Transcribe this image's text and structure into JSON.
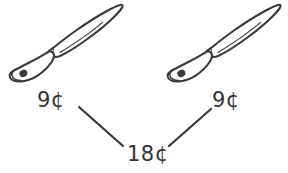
{
  "diagram": {
    "type": "addition-number-bond",
    "background_color": "#ffffff",
    "ink_color": "#3a3a3a",
    "items": [
      {
        "id": "knife-left",
        "icon": "knife-icon",
        "name": "knife",
        "price_label": "9¢"
      },
      {
        "id": "knife-right",
        "icon": "knife-icon",
        "name": "knife",
        "price_label": "9¢"
      }
    ],
    "total": {
      "label": "18¢"
    },
    "connectors": [
      {
        "id": "connector-left",
        "from": "label-left-price",
        "to": "label-total"
      },
      {
        "id": "connector-right",
        "from": "label-right-price",
        "to": "label-total"
      }
    ]
  }
}
